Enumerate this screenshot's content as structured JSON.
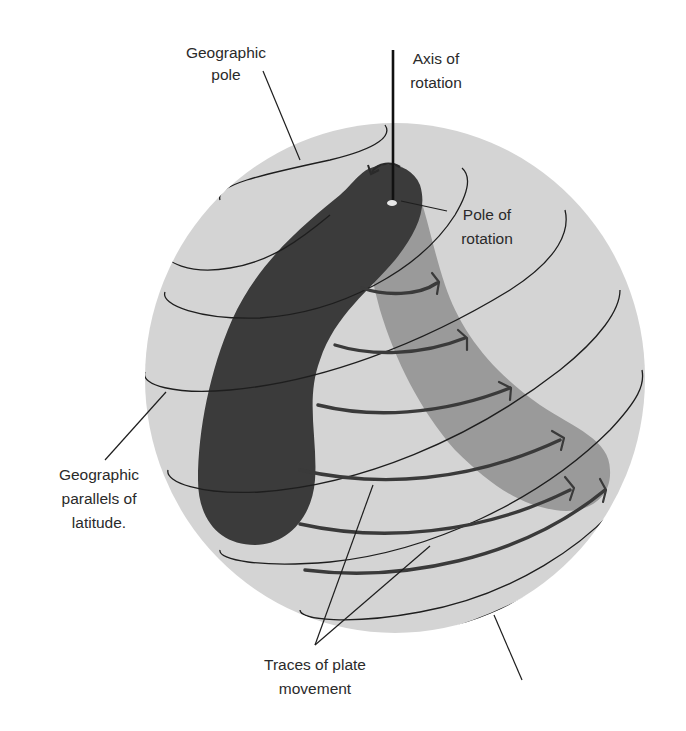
{
  "figure": {
    "colors": {
      "background": "#ffffff",
      "sphere": "#d4d4d4",
      "dark_plate": "#3b3b3b",
      "light_plate": "#9a9a9a",
      "lines": "#1e1e1e",
      "traces": "#3a3a3a"
    }
  },
  "labels": {
    "geographic_pole": {
      "line1": "Geographic",
      "line2": "pole"
    },
    "axis_of_rotation": {
      "line1": "Axis of",
      "line2": "rotation"
    },
    "pole_of_rotation": {
      "line1": "Pole of",
      "line2": "rotation"
    },
    "parallels": {
      "line1": "Geographic",
      "line2": "parallels of",
      "line3": "latitude."
    },
    "traces": {
      "line1": "Traces of plate",
      "line2": "movement"
    }
  },
  "elements": {
    "sphere": "globe",
    "dark_plate": "plate-original-position",
    "light_plate": "plate-rotated-position",
    "parallel_count": 8,
    "trace_arrow_count": 6
  }
}
